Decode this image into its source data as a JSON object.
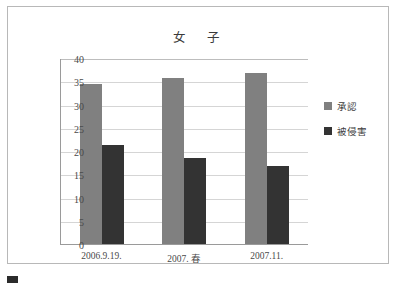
{
  "chart_data": {
    "type": "bar",
    "title": "女　子",
    "xlabel": "",
    "ylabel": "",
    "ylim": [
      0,
      40
    ],
    "ystep": 5,
    "yticks": [
      "0",
      "5",
      "10",
      "15",
      "20",
      "25",
      "30",
      "35",
      "40"
    ],
    "grid": true,
    "legend_position": "right",
    "categories": [
      "2006.9.19.",
      "2007. 春",
      "2007.11."
    ],
    "series": [
      {
        "name": "承認",
        "color": "#808080",
        "values": [
          34.5,
          35.8,
          36.7
        ]
      },
      {
        "name": "被侵害",
        "color": "#333333",
        "values": [
          21.3,
          18.5,
          16.8
        ]
      }
    ]
  },
  "caption": {
    "text": "",
    "marker": "figure-marker"
  }
}
